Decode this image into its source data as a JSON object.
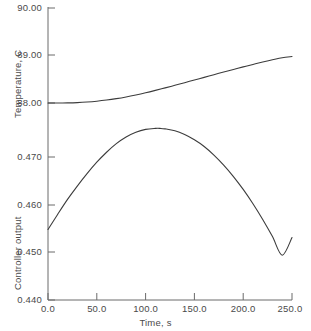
{
  "chart_data": {
    "type": "line",
    "title": "",
    "subtitle": "",
    "xlabel": "Time, s",
    "panels": [
      {
        "name": "temperature-panel",
        "ylabel": "Temperature, C",
        "ylim": [
          88.0,
          90.0
        ],
        "yticks": [
          88.0,
          89.0,
          90.0
        ],
        "ytick_labels": [
          "88.00",
          "89.00",
          "90.00"
        ],
        "grid": false,
        "series": [
          {
            "name": "temperature",
            "color": "#3c3c3c",
            "x": [
              0,
              10,
              20,
              30,
              40,
              50,
              60,
              70,
              80,
              90,
              100,
              110,
              120,
              130,
              140,
              150,
              160,
              170,
              180,
              190,
              200,
              210,
              220,
              230,
              240,
              250
            ],
            "values": [
              88.0,
              88.0,
              88.002,
              88.008,
              88.02,
              88.038,
              88.062,
              88.092,
              88.128,
              88.17,
              88.216,
              88.266,
              88.318,
              88.372,
              88.428,
              88.484,
              88.54,
              88.596,
              88.652,
              88.706,
              88.76,
              88.812,
              88.862,
              88.91,
              88.954,
              88.978
            ]
          }
        ]
      },
      {
        "name": "controller-output-panel",
        "ylabel": "Controller output",
        "ylim": [
          0.44,
          0.475
        ],
        "yticks": [
          0.44,
          0.45,
          0.46,
          0.47
        ],
        "ytick_labels": [
          "0.440",
          "0.450",
          "0.460",
          "0.470"
        ],
        "grid": false,
        "series": [
          {
            "name": "controller-output",
            "color": "#3c3c3c",
            "x": [
              0,
              10,
              20,
              30,
              40,
              50,
              60,
              70,
              80,
              90,
              100,
              110,
              115,
              120,
              130,
              140,
              150,
              160,
              170,
              180,
              190,
              200,
              210,
              220,
              230,
              240,
              250
            ],
            "values": [
              0.4548,
              0.458,
              0.4611,
              0.4639,
              0.4665,
              0.4689,
              0.471,
              0.4728,
              0.4742,
              0.4752,
              0.4758,
              0.476,
              0.476,
              0.4759,
              0.4755,
              0.4747,
              0.4736,
              0.4722,
              0.4704,
              0.4683,
              0.4659,
              0.4632,
              0.4602,
              0.4569,
              0.4533,
              0.4494,
              0.4531
            ]
          }
        ]
      }
    ],
    "xlim": [
      0,
      250
    ],
    "xticks": [
      0,
      50,
      100,
      150,
      200,
      250
    ],
    "xtick_labels": [
      "0.0",
      "50.0",
      "100.0",
      "150.0",
      "200.0",
      "250.0"
    ],
    "legend": null,
    "legend_position": "none",
    "annotations": []
  },
  "axis_style": {
    "line_color": "#6b6b6b",
    "curve_color": "#3c3c3c",
    "background": "#ffffff"
  }
}
